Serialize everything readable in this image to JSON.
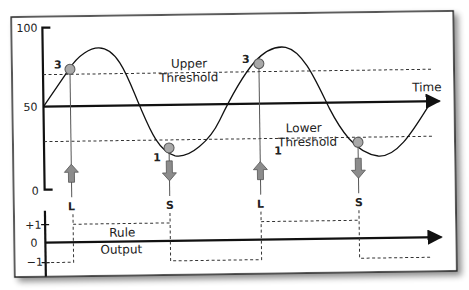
{
  "diagram": {
    "top_chart": {
      "y_ticks": {
        "top": "100",
        "mid": "50",
        "bottom": "0"
      },
      "axis_label": "Time",
      "upper_threshold_label": [
        "Upper",
        "Threshold"
      ],
      "lower_threshold_label": [
        "Lower",
        "Threshold"
      ],
      "crossing_markers": [
        {
          "label": "3",
          "type": "upper"
        },
        {
          "label": "1",
          "type": "lower"
        },
        {
          "label": "3",
          "type": "upper"
        },
        {
          "label": "1",
          "type": "lower"
        }
      ],
      "signals": [
        {
          "label": "L",
          "direction": "up"
        },
        {
          "label": "S",
          "direction": "down"
        },
        {
          "label": "L",
          "direction": "up"
        },
        {
          "label": "S",
          "direction": "down"
        }
      ]
    },
    "bottom_chart": {
      "y_ticks": {
        "plus": "+1",
        "zero": "0",
        "minus": "−1"
      },
      "title": [
        "Rule",
        "Output"
      ],
      "output_sequence": [
        -1,
        1,
        -1,
        1,
        -1
      ]
    },
    "colors": {
      "line": "#111111",
      "marker_fill": "#a9a9a9",
      "arrow_fill": "#8c8c8c",
      "frame": "#222222",
      "shadow": "#9a9a9a"
    }
  }
}
